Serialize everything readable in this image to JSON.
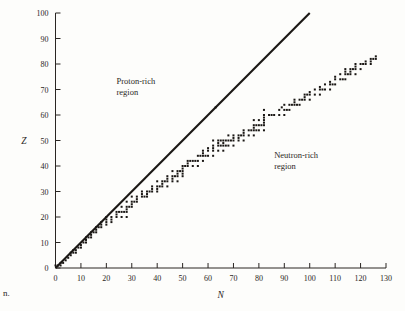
{
  "figure": {
    "caption_fragment": "n.",
    "background_color": "#fdfdfb",
    "ink_color": "#1a1714"
  },
  "labels": {
    "proton_region_line1": "Proton-rich",
    "proton_region_line2": "region",
    "neutron_region_line1": "Neutron-rich",
    "neutron_region_line2": "region",
    "y_axis_title": "Z",
    "x_axis_title": "N"
  },
  "chart_data": {
    "type": "scatter",
    "title": "",
    "subtitle": "",
    "xlabel": "N",
    "ylabel": "Z",
    "xlim": [
      0,
      130
    ],
    "ylim": [
      0,
      100
    ],
    "xticks": [
      0,
      10,
      20,
      30,
      40,
      50,
      60,
      70,
      80,
      90,
      100,
      110,
      120,
      130
    ],
    "yticks": [
      0,
      10,
      20,
      30,
      40,
      50,
      60,
      70,
      80,
      90,
      100
    ],
    "xticklabels": [
      "0",
      "10",
      "20",
      "30",
      "40",
      "50",
      "60",
      "70",
      "80",
      "90",
      "100",
      "110",
      "120",
      "130"
    ],
    "yticklabels": [
      "0",
      "10",
      "20",
      "30",
      "40",
      "50",
      "60",
      "70",
      "80",
      "90",
      "100"
    ],
    "grid": false,
    "legend": "none",
    "annotations": [
      {
        "text": "Proton-rich region",
        "x": 24,
        "y": 72
      },
      {
        "text": "Neutron-rich region",
        "x": 86,
        "y": 43
      }
    ],
    "reference_line": {
      "name": "N = Z line",
      "x0": 0,
      "y0": 0,
      "x1": 100,
      "y1": 100,
      "style": "solid",
      "color": "#1b1815"
    },
    "series": [
      {
        "name": "Stable nuclides",
        "marker": "square",
        "marker_size": 2,
        "color": "#1a1714",
        "points": [
          [
            0,
            1
          ],
          [
            1,
            1
          ],
          [
            2,
            2
          ],
          [
            2,
            1
          ],
          [
            3,
            2
          ],
          [
            4,
            3
          ],
          [
            5,
            4
          ],
          [
            6,
            6
          ],
          [
            6,
            5
          ],
          [
            7,
            6
          ],
          [
            8,
            7
          ],
          [
            8,
            6
          ],
          [
            7,
            7
          ],
          [
            10,
            8
          ],
          [
            9,
            8
          ],
          [
            10,
            9
          ],
          [
            12,
            10
          ],
          [
            11,
            10
          ],
          [
            12,
            11
          ],
          [
            14,
            12
          ],
          [
            13,
            12
          ],
          [
            12,
            12
          ],
          [
            14,
            13
          ],
          [
            16,
            14
          ],
          [
            15,
            14
          ],
          [
            14,
            14
          ],
          [
            16,
            15
          ],
          [
            18,
            16
          ],
          [
            17,
            16
          ],
          [
            16,
            16
          ],
          [
            20,
            17
          ],
          [
            18,
            17
          ],
          [
            22,
            18
          ],
          [
            20,
            18
          ],
          [
            18,
            18
          ],
          [
            20,
            19
          ],
          [
            22,
            19
          ],
          [
            24,
            20
          ],
          [
            22,
            20
          ],
          [
            20,
            20
          ],
          [
            26,
            20
          ],
          [
            28,
            20
          ],
          [
            24,
            21
          ],
          [
            26,
            22
          ],
          [
            25,
            22
          ],
          [
            24,
            22
          ],
          [
            27,
            22
          ],
          [
            28,
            22
          ],
          [
            28,
            23
          ],
          [
            26,
            24
          ],
          [
            28,
            24
          ],
          [
            29,
            24
          ],
          [
            30,
            24
          ],
          [
            30,
            25
          ],
          [
            28,
            26
          ],
          [
            30,
            26
          ],
          [
            31,
            26
          ],
          [
            32,
            26
          ],
          [
            32,
            27
          ],
          [
            30,
            28
          ],
          [
            32,
            28
          ],
          [
            34,
            28
          ],
          [
            35,
            28
          ],
          [
            36,
            28
          ],
          [
            34,
            29
          ],
          [
            36,
            29
          ],
          [
            34,
            30
          ],
          [
            36,
            30
          ],
          [
            37,
            30
          ],
          [
            38,
            30
          ],
          [
            40,
            30
          ],
          [
            38,
            31
          ],
          [
            40,
            31
          ],
          [
            38,
            32
          ],
          [
            40,
            32
          ],
          [
            41,
            32
          ],
          [
            42,
            32
          ],
          [
            44,
            32
          ],
          [
            42,
            33
          ],
          [
            40,
            34
          ],
          [
            42,
            34
          ],
          [
            43,
            34
          ],
          [
            44,
            34
          ],
          [
            46,
            34
          ],
          [
            48,
            34
          ],
          [
            44,
            35
          ],
          [
            46,
            35
          ],
          [
            44,
            36
          ],
          [
            46,
            36
          ],
          [
            47,
            36
          ],
          [
            48,
            36
          ],
          [
            50,
            36
          ],
          [
            48,
            37
          ],
          [
            50,
            37
          ],
          [
            46,
            38
          ],
          [
            48,
            38
          ],
          [
            49,
            38
          ],
          [
            50,
            38
          ],
          [
            50,
            39
          ],
          [
            50,
            40
          ],
          [
            51,
            40
          ],
          [
            52,
            40
          ],
          [
            54,
            40
          ],
          [
            56,
            40
          ],
          [
            52,
            41
          ],
          [
            52,
            42
          ],
          [
            53,
            42
          ],
          [
            54,
            42
          ],
          [
            55,
            42
          ],
          [
            56,
            42
          ],
          [
            58,
            42
          ],
          [
            56,
            44
          ],
          [
            57,
            44
          ],
          [
            58,
            44
          ],
          [
            59,
            44
          ],
          [
            60,
            44
          ],
          [
            62,
            44
          ],
          [
            58,
            45
          ],
          [
            58,
            46
          ],
          [
            60,
            46
          ],
          [
            62,
            46
          ],
          [
            64,
            46
          ],
          [
            66,
            46
          ],
          [
            60,
            47
          ],
          [
            62,
            47
          ],
          [
            62,
            48
          ],
          [
            64,
            48
          ],
          [
            65,
            48
          ],
          [
            66,
            48
          ],
          [
            67,
            48
          ],
          [
            68,
            48
          ],
          [
            70,
            48
          ],
          [
            64,
            49
          ],
          [
            66,
            49
          ],
          [
            62,
            50
          ],
          [
            64,
            50
          ],
          [
            65,
            50
          ],
          [
            66,
            50
          ],
          [
            67,
            50
          ],
          [
            68,
            50
          ],
          [
            69,
            50
          ],
          [
            70,
            50
          ],
          [
            72,
            50
          ],
          [
            74,
            50
          ],
          [
            70,
            51
          ],
          [
            72,
            51
          ],
          [
            68,
            52
          ],
          [
            70,
            52
          ],
          [
            72,
            52
          ],
          [
            73,
            52
          ],
          [
            74,
            52
          ],
          [
            76,
            52
          ],
          [
            78,
            52
          ],
          [
            74,
            53
          ],
          [
            74,
            54
          ],
          [
            76,
            54
          ],
          [
            77,
            54
          ],
          [
            78,
            54
          ],
          [
            79,
            54
          ],
          [
            80,
            54
          ],
          [
            82,
            54
          ],
          [
            78,
            55
          ],
          [
            78,
            56
          ],
          [
            79,
            56
          ],
          [
            80,
            56
          ],
          [
            81,
            56
          ],
          [
            82,
            56
          ],
          [
            82,
            57
          ],
          [
            82,
            58
          ],
          [
            80,
            58
          ],
          [
            78,
            58
          ],
          [
            82,
            59
          ],
          [
            82,
            60
          ],
          [
            84,
            60
          ],
          [
            85,
            60
          ],
          [
            86,
            60
          ],
          [
            88,
            60
          ],
          [
            90,
            60
          ],
          [
            82,
            62
          ],
          [
            88,
            62
          ],
          [
            90,
            62
          ],
          [
            91,
            62
          ],
          [
            92,
            62
          ],
          [
            63,
            63
          ],
          [
            89,
            63
          ],
          [
            90,
            64
          ],
          [
            92,
            64
          ],
          [
            93,
            64
          ],
          [
            94,
            64
          ],
          [
            95,
            64
          ],
          [
            96,
            64
          ],
          [
            94,
            65
          ],
          [
            94,
            66
          ],
          [
            96,
            66
          ],
          [
            97,
            66
          ],
          [
            98,
            66
          ],
          [
            100,
            66
          ],
          [
            98,
            67
          ],
          [
            98,
            68
          ],
          [
            99,
            68
          ],
          [
            100,
            68
          ],
          [
            102,
            68
          ],
          [
            104,
            68
          ],
          [
            100,
            69
          ],
          [
            102,
            70
          ],
          [
            104,
            70
          ],
          [
            105,
            70
          ],
          [
            106,
            70
          ],
          [
            108,
            70
          ],
          [
            104,
            71
          ],
          [
            106,
            72
          ],
          [
            108,
            72
          ],
          [
            109,
            72
          ],
          [
            110,
            72
          ],
          [
            108,
            73
          ],
          [
            110,
            74
          ],
          [
            112,
            74
          ],
          [
            113,
            74
          ],
          [
            114,
            74
          ],
          [
            110,
            75
          ],
          [
            112,
            76
          ],
          [
            114,
            76
          ],
          [
            115,
            76
          ],
          [
            116,
            76
          ],
          [
            118,
            76
          ],
          [
            114,
            77
          ],
          [
            116,
            77
          ],
          [
            114,
            78
          ],
          [
            116,
            78
          ],
          [
            117,
            78
          ],
          [
            118,
            78
          ],
          [
            120,
            78
          ],
          [
            118,
            79
          ],
          [
            118,
            80
          ],
          [
            120,
            80
          ],
          [
            121,
            80
          ],
          [
            122,
            80
          ],
          [
            124,
            80
          ],
          [
            122,
            81
          ],
          [
            124,
            81
          ],
          [
            124,
            82
          ],
          [
            125,
            82
          ],
          [
            126,
            82
          ],
          [
            126,
            83
          ]
        ]
      }
    ]
  }
}
